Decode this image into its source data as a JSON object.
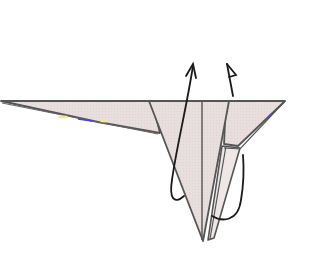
{
  "diagram": {
    "type": "origami-fold-step",
    "colors": {
      "background": "#ffffff",
      "paper_fill": "#e8dcdc",
      "paper_fill_back": "#f2ecec",
      "edge_stroke": "#555555",
      "arrow_stroke": "#1a1a1a",
      "highlight_blue": "#4040e0",
      "highlight_yellow": "#f0e060"
    },
    "arrows": [
      {
        "name": "valley-fold-arrow-left",
        "kind": "fold-up-arrow",
        "head": "open-v"
      },
      {
        "name": "mountain-fold-arrow-right",
        "kind": "fold-behind-arrow",
        "head": "half-arrow"
      }
    ],
    "caption": ""
  }
}
